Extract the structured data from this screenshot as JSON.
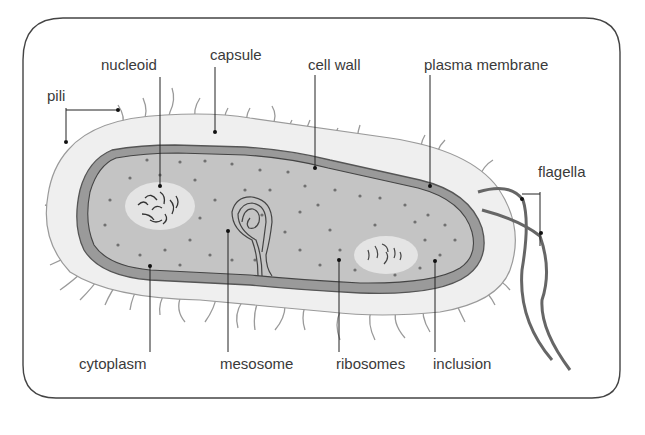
{
  "diagram": {
    "colors": {
      "frame": "#444444",
      "capsule": "#efefef",
      "cell_wall": "#9a9a9a",
      "cytoplasm": "#c4c4c4",
      "ribosome_dot": "#707070",
      "nucleoid_region": "#e4e4e4",
      "flagella": "#666666",
      "pili": "#9a9a9a",
      "label_text": "#3a3a3a"
    },
    "labels": {
      "nucleoid": "nucleoid",
      "capsule": "capsule",
      "cell_wall": "cell wall",
      "plasma_membrane": "plasma membrane",
      "pili": "pili",
      "flagella": "flagella",
      "cytoplasm": "cytoplasm",
      "mesosome": "mesosome",
      "ribosomes": "ribosomes",
      "inclusion": "inclusion"
    }
  }
}
